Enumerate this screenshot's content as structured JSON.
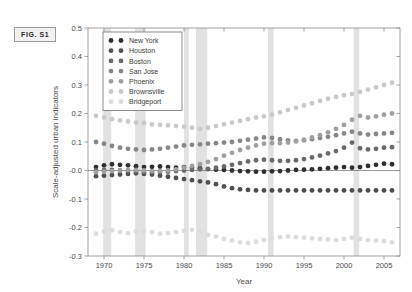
{
  "figure": {
    "label": "FIG. S1"
  },
  "chart_data": {
    "type": "scatter",
    "title": "",
    "xlabel": "Year",
    "ylabel": "Scale-adjusted urban indicators",
    "xlim": [
      1968,
      2007
    ],
    "ylim": [
      -0.3,
      0.5
    ],
    "xticks": [
      1970,
      1975,
      1980,
      1985,
      1990,
      1995,
      2000,
      2005
    ],
    "xticklabels": [
      "1970",
      "1975",
      "1980",
      "1985",
      "1990",
      "1995",
      "2000",
      "2005"
    ],
    "yticks": [
      -0.3,
      -0.2,
      -0.1,
      0.0,
      0.1,
      0.2,
      0.3,
      0.4,
      0.5
    ],
    "yticklabels": [
      "-0.3",
      "-0.2",
      "-0.1",
      "-0.0",
      "0.1",
      "0.2",
      "0.3",
      "0.4",
      "0.5"
    ],
    "grid": false,
    "legend_position": "upper-left",
    "zero_line": 0.0,
    "recession_bands": [
      [
        1969.9,
        1970.9
      ],
      [
        1973.9,
        1975.2
      ],
      [
        1980.0,
        1980.6
      ],
      [
        1981.5,
        1982.9
      ],
      [
        1990.5,
        1991.2
      ],
      [
        2001.2,
        2001.9
      ]
    ],
    "x": [
      1969,
      1970,
      1971,
      1972,
      1973,
      1974,
      1975,
      1976,
      1977,
      1978,
      1979,
      1980,
      1981,
      1982,
      1983,
      1984,
      1985,
      1986,
      1987,
      1988,
      1989,
      1990,
      1991,
      1992,
      1993,
      1994,
      1995,
      1996,
      1997,
      1998,
      1999,
      2000,
      2001,
      2002,
      2003,
      2004,
      2005,
      2006
    ],
    "series": [
      {
        "name": "New York",
        "color": "#2f2f2f",
        "values": [
          0.012,
          0.018,
          0.022,
          0.02,
          0.018,
          0.015,
          0.012,
          0.013,
          0.014,
          0.012,
          0.01,
          0.012,
          0.01,
          0.008,
          0.005,
          0.003,
          0.002,
          0.0,
          -0.002,
          -0.003,
          -0.004,
          -0.004,
          -0.003,
          -0.002,
          0.0,
          0.002,
          0.003,
          0.004,
          0.006,
          0.008,
          0.01,
          0.012,
          0.01,
          0.012,
          0.016,
          0.02,
          0.024,
          0.022
        ]
      },
      {
        "name": "Houston",
        "color": "#4f4f4f",
        "values": [
          -0.02,
          -0.018,
          -0.016,
          -0.014,
          -0.012,
          -0.01,
          -0.012,
          -0.014,
          -0.018,
          -0.022,
          -0.026,
          -0.03,
          -0.034,
          -0.038,
          -0.042,
          -0.048,
          -0.056,
          -0.062,
          -0.066,
          -0.068,
          -0.07,
          -0.07,
          -0.07,
          -0.07,
          -0.07,
          -0.07,
          -0.07,
          -0.07,
          -0.07,
          -0.07,
          -0.07,
          -0.07,
          -0.07,
          -0.07,
          -0.07,
          -0.07,
          -0.07,
          -0.07
        ]
      },
      {
        "name": "Boston",
        "color": "#6a6a6a",
        "values": [
          0.0,
          0.002,
          0.002,
          0.0,
          -0.002,
          -0.004,
          -0.006,
          -0.006,
          -0.005,
          -0.004,
          -0.002,
          0.0,
          0.002,
          0.004,
          0.006,
          0.01,
          0.014,
          0.02,
          0.026,
          0.032,
          0.036,
          0.038,
          0.036,
          0.034,
          0.034,
          0.036,
          0.04,
          0.046,
          0.052,
          0.06,
          0.068,
          0.08,
          0.098,
          0.078,
          0.074,
          0.076,
          0.08,
          0.082
        ]
      },
      {
        "name": "San Jose",
        "color": "#878787",
        "values": [
          0.1,
          0.094,
          0.086,
          0.08,
          0.076,
          0.074,
          0.072,
          0.074,
          0.076,
          0.08,
          0.084,
          0.088,
          0.09,
          0.092,
          0.094,
          0.096,
          0.098,
          0.1,
          0.104,
          0.108,
          0.112,
          0.116,
          0.114,
          0.11,
          0.106,
          0.104,
          0.106,
          0.11,
          0.114,
          0.118,
          0.124,
          0.13,
          0.136,
          0.13,
          0.126,
          0.128,
          0.13,
          0.132
        ]
      },
      {
        "name": "Phoenix",
        "color": "#a0a0a0",
        "values": [
          -0.006,
          -0.004,
          -0.002,
          0.0,
          0.002,
          0.002,
          0.0,
          -0.002,
          -0.002,
          0.0,
          0.004,
          0.01,
          0.016,
          0.022,
          0.03,
          0.04,
          0.052,
          0.062,
          0.072,
          0.08,
          0.088,
          0.094,
          0.096,
          0.096,
          0.098,
          0.102,
          0.108,
          0.116,
          0.124,
          0.134,
          0.146,
          0.16,
          0.178,
          0.192,
          0.186,
          0.19,
          0.196,
          0.2
        ]
      },
      {
        "name": "Brownsville",
        "color": "#c9c9c9",
        "values": [
          0.192,
          0.186,
          0.18,
          0.176,
          0.172,
          0.168,
          0.166,
          0.162,
          0.16,
          0.158,
          0.156,
          0.154,
          0.15,
          0.146,
          0.15,
          0.156,
          0.162,
          0.168,
          0.174,
          0.18,
          0.186,
          0.19,
          0.196,
          0.204,
          0.212,
          0.22,
          0.228,
          0.236,
          0.244,
          0.252,
          0.258,
          0.264,
          0.268,
          0.276,
          0.284,
          0.292,
          0.3,
          0.308
        ]
      },
      {
        "name": "Bridgeport",
        "color": "#dcdcdc",
        "values": [
          -0.222,
          -0.214,
          -0.21,
          -0.216,
          -0.22,
          -0.214,
          -0.212,
          -0.216,
          -0.222,
          -0.22,
          -0.216,
          -0.212,
          -0.208,
          -0.214,
          -0.226,
          -0.232,
          -0.24,
          -0.246,
          -0.252,
          -0.254,
          -0.25,
          -0.244,
          -0.238,
          -0.234,
          -0.232,
          -0.234,
          -0.236,
          -0.238,
          -0.24,
          -0.242,
          -0.244,
          -0.24,
          -0.236,
          -0.24,
          -0.244,
          -0.246,
          -0.248,
          -0.252
        ]
      }
    ]
  }
}
